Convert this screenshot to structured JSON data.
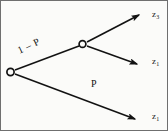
{
  "figure": {
    "background_color": "#fbfbf9",
    "stroke_color": "#121212",
    "border_color": "#6f6f6f"
  },
  "nodes": [
    {
      "id": "root",
      "name": "root-node",
      "x": 9,
      "y": 71,
      "style": "open-circle"
    },
    {
      "id": "branch",
      "name": "branch-node",
      "x": 81,
      "y": 43,
      "style": "open-circle"
    }
  ],
  "edges": [
    {
      "id": "edge-upper",
      "from": "root",
      "to": "branch",
      "label": "1 − P",
      "arrow": false
    },
    {
      "id": "edge-top",
      "from": "branch",
      "to": "leaf-top",
      "label": "",
      "arrow": true
    },
    {
      "id": "edge-middle",
      "from": "branch",
      "to": "leaf-middle",
      "label": "",
      "arrow": true
    },
    {
      "id": "edge-lower",
      "from": "root",
      "to": "leaf-bottom",
      "label": "P",
      "arrow": true
    }
  ],
  "edge_labels": {
    "upper": "1 – P",
    "lower": "P"
  },
  "leaves": [
    {
      "id": "leaf-top",
      "symbol": "z",
      "subscript": "3"
    },
    {
      "id": "leaf-middle",
      "symbol": "z",
      "subscript": "1"
    },
    {
      "id": "leaf-bottom",
      "symbol": "z",
      "subscript": "1"
    }
  ]
}
